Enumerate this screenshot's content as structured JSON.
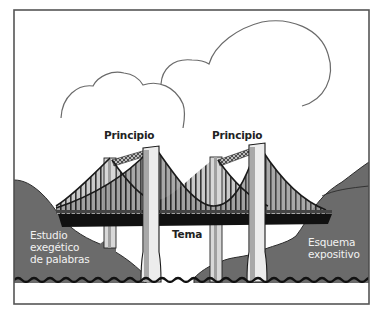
{
  "figure": {
    "colors": {
      "frame": "#555555",
      "hill_fill": "#6b6b6b",
      "hill_stroke": "#333333",
      "deck": "#111111",
      "tower_fill": "#e8e8e8",
      "tower_shade": "#a8a8a8",
      "cable": "#222222",
      "hanger": "#555555",
      "sky": "#ffffff",
      "water_line": "#111111",
      "cloud_stroke": "#666666"
    },
    "labels": {
      "principio_left": "Principio",
      "principio_right": "Principio",
      "tema": "Tema",
      "estudio_line1": "Estudio",
      "estudio_line2": "exegético",
      "estudio_line3": "de palabras",
      "esquema_line1": "Esquema",
      "esquema_line2": "expositivo"
    },
    "elements": {
      "clouds": 2,
      "towers": 4,
      "hills": [
        "left",
        "right"
      ]
    }
  }
}
